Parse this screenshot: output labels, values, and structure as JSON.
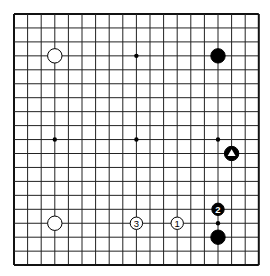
{
  "board": {
    "size": 19,
    "origin_x": 14,
    "origin_y": 14,
    "spacing_x": 13.6,
    "spacing_y": 13.95,
    "line_color": "#222222",
    "border_color": "#111111",
    "background": "#ffffff",
    "star_points": [
      [
        3,
        3
      ],
      [
        9,
        3
      ],
      [
        15,
        3
      ],
      [
        3,
        9
      ],
      [
        9,
        9
      ],
      [
        15,
        9
      ],
      [
        3,
        15
      ],
      [
        9,
        15
      ],
      [
        15,
        15
      ]
    ]
  },
  "stones": [
    {
      "color": "white",
      "col": 3,
      "row": 3,
      "label": ""
    },
    {
      "color": "black",
      "col": 15,
      "row": 3,
      "label": ""
    },
    {
      "color": "black",
      "col": 16,
      "row": 10,
      "label": "",
      "marker": "triangle"
    },
    {
      "color": "white",
      "col": 3,
      "row": 15,
      "label": ""
    },
    {
      "color": "white",
      "col": 9,
      "row": 15,
      "label": "3"
    },
    {
      "color": "white",
      "col": 12,
      "row": 15,
      "label": "1"
    },
    {
      "color": "black",
      "col": 15,
      "row": 14,
      "label": "2"
    },
    {
      "color": "black",
      "col": 15,
      "row": 16,
      "label": ""
    }
  ]
}
